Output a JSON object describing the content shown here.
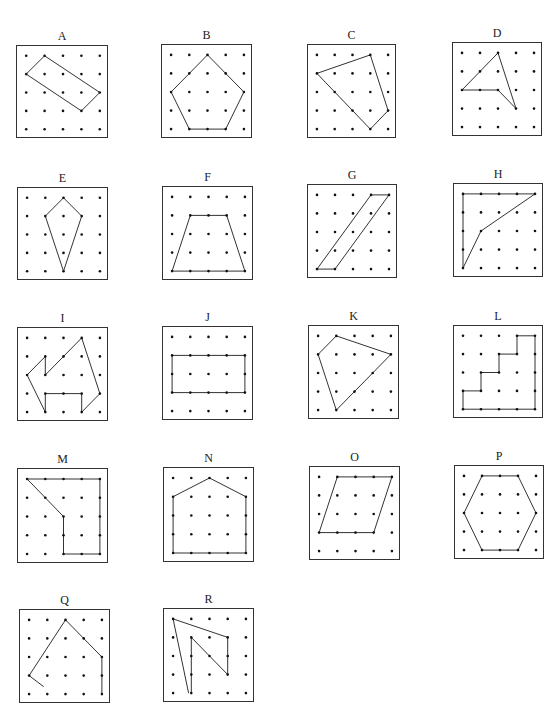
{
  "figure": {
    "grid": {
      "cols": 5,
      "rows": 5
    },
    "colors": {
      "line": "#333333",
      "dot": "#111111",
      "border": "#333333",
      "background": "#ffffff"
    },
    "boards": [
      {
        "label": "A",
        "x": 16,
        "y": 45,
        "w": 92,
        "h": 93,
        "closed": true,
        "vertices": [
          [
            1,
            0
          ],
          [
            0,
            1
          ],
          [
            3,
            3
          ],
          [
            4,
            2
          ]
        ]
      },
      {
        "label": "B",
        "x": 161,
        "y": 44,
        "w": 91,
        "h": 94,
        "closed": true,
        "vertices": [
          [
            2,
            0
          ],
          [
            0,
            2
          ],
          [
            1,
            4
          ],
          [
            3,
            4
          ],
          [
            4,
            2
          ]
        ]
      },
      {
        "label": "C",
        "x": 307,
        "y": 44,
        "w": 89,
        "h": 94,
        "closed": true,
        "vertices": [
          [
            3,
            0
          ],
          [
            0,
            1
          ],
          [
            3,
            4
          ],
          [
            4,
            3
          ]
        ]
      },
      {
        "label": "D",
        "x": 452,
        "y": 42,
        "w": 90,
        "h": 94,
        "closed": true,
        "vertices": [
          [
            2,
            0
          ],
          [
            0,
            2
          ],
          [
            2,
            2
          ],
          [
            3,
            3
          ]
        ]
      },
      {
        "label": "E",
        "x": 17,
        "y": 187,
        "w": 91,
        "h": 93,
        "closed": true,
        "vertices": [
          [
            2,
            0
          ],
          [
            1,
            1
          ],
          [
            2,
            4
          ],
          [
            3,
            1
          ]
        ]
      },
      {
        "label": "F",
        "x": 162,
        "y": 186,
        "w": 91,
        "h": 94,
        "closed": true,
        "vertices": [
          [
            1,
            1
          ],
          [
            3,
            1
          ],
          [
            4,
            4
          ],
          [
            0,
            4
          ]
        ]
      },
      {
        "label": "G",
        "x": 307,
        "y": 184,
        "w": 90,
        "h": 94,
        "closed": true,
        "vertices": [
          [
            3,
            0
          ],
          [
            4,
            0
          ],
          [
            1,
            4
          ],
          [
            0,
            4
          ]
        ]
      },
      {
        "label": "H",
        "x": 453,
        "y": 183,
        "w": 90,
        "h": 94,
        "closed": true,
        "vertices": [
          [
            0,
            0
          ],
          [
            4,
            0
          ],
          [
            1,
            2
          ],
          [
            0,
            4
          ]
        ]
      },
      {
        "label": "I",
        "x": 17,
        "y": 327,
        "w": 91,
        "h": 94,
        "closed": true,
        "vertices": [
          [
            3,
            0
          ],
          [
            1,
            2
          ],
          [
            1,
            1
          ],
          [
            0,
            2
          ],
          [
            1,
            4
          ],
          [
            1,
            3
          ],
          [
            3,
            3
          ],
          [
            3,
            4
          ],
          [
            4,
            3
          ]
        ]
      },
      {
        "label": "J",
        "x": 162,
        "y": 326,
        "w": 91,
        "h": 94,
        "closed": true,
        "vertices": [
          [
            0,
            1
          ],
          [
            4,
            1
          ],
          [
            4,
            3
          ],
          [
            0,
            3
          ]
        ]
      },
      {
        "label": "K",
        "x": 308,
        "y": 325,
        "w": 91,
        "h": 94,
        "closed": true,
        "vertices": [
          [
            1,
            0
          ],
          [
            0,
            1
          ],
          [
            1,
            4
          ],
          [
            4,
            1
          ]
        ]
      },
      {
        "label": "L",
        "x": 453,
        "y": 325,
        "w": 90,
        "h": 93,
        "closed": true,
        "vertices": [
          [
            3,
            0
          ],
          [
            4,
            0
          ],
          [
            4,
            4
          ],
          [
            0,
            4
          ],
          [
            0,
            3
          ],
          [
            1,
            3
          ],
          [
            1,
            2
          ],
          [
            2,
            2
          ],
          [
            2,
            1
          ],
          [
            3,
            1
          ]
        ]
      },
      {
        "label": "M",
        "x": 17,
        "y": 468,
        "w": 91,
        "h": 95,
        "closed": true,
        "vertices": [
          [
            0,
            0
          ],
          [
            4,
            0
          ],
          [
            4,
            4
          ],
          [
            2,
            4
          ],
          [
            2,
            2
          ]
        ]
      },
      {
        "label": "N",
        "x": 163,
        "y": 467,
        "w": 91,
        "h": 95,
        "closed": true,
        "vertices": [
          [
            2,
            0
          ],
          [
            0,
            1
          ],
          [
            0,
            4
          ],
          [
            4,
            4
          ],
          [
            4,
            1
          ]
        ]
      },
      {
        "label": "O",
        "x": 309,
        "y": 466,
        "w": 91,
        "h": 94,
        "closed": true,
        "vertices": [
          [
            1,
            0
          ],
          [
            4,
            0
          ],
          [
            3,
            3
          ],
          [
            0,
            3
          ]
        ]
      },
      {
        "label": "P",
        "x": 454,
        "y": 465,
        "w": 90,
        "h": 94,
        "closed": true,
        "vertices": [
          [
            1,
            0
          ],
          [
            3,
            0
          ],
          [
            4,
            2
          ],
          [
            3,
            4
          ],
          [
            1,
            4
          ],
          [
            0,
            2
          ]
        ]
      },
      {
        "label": "Q",
        "x": 19,
        "y": 609,
        "w": 91,
        "h": 94,
        "closed": false,
        "vertices": [
          [
            0.8,
            3.6
          ],
          [
            0,
            3
          ],
          [
            2,
            0
          ],
          [
            4,
            2
          ],
          [
            4,
            4
          ]
        ]
      },
      {
        "label": "R",
        "x": 163,
        "y": 608,
        "w": 91,
        "h": 94,
        "closed": false,
        "vertices": [
          [
            0.85,
            4
          ],
          [
            0,
            0
          ],
          [
            3,
            1
          ],
          [
            3,
            3
          ],
          [
            1,
            1
          ],
          [
            1,
            4
          ]
        ]
      }
    ]
  }
}
